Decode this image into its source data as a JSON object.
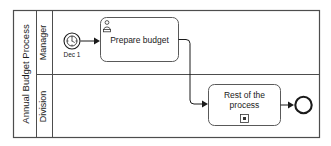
{
  "diagram": {
    "type": "bpmn-process-diagram",
    "pool": {
      "name": "Annual Budget Process",
      "lanes": [
        {
          "id": "manager",
          "name": "Manager"
        },
        {
          "id": "division",
          "name": "Division"
        }
      ]
    },
    "elements": [
      {
        "id": "start-timer",
        "kind": "timer-start-event",
        "lane": "manager",
        "label": "Dec 1",
        "icon": "clock-icon"
      },
      {
        "id": "prepare-budget",
        "kind": "user-task",
        "lane": "manager",
        "label": "Prepare budget",
        "icon": "user-task-icon"
      },
      {
        "id": "rest-of-process",
        "kind": "collapsed-subprocess",
        "lane": "division",
        "label_line1": "Rest of the",
        "label_line2": "process",
        "icon": "subprocess-marker-icon"
      },
      {
        "id": "end-event",
        "kind": "end-event",
        "lane": "division",
        "label": ""
      }
    ],
    "flows": [
      {
        "id": "flow-start-to-task",
        "from": "start-timer",
        "to": "prepare-budget"
      },
      {
        "id": "flow-task-to-subprocess",
        "from": "prepare-budget",
        "to": "rest-of-process"
      },
      {
        "id": "flow-subprocess-to-end",
        "from": "rest-of-process",
        "to": "end-event"
      }
    ],
    "colors": {
      "background": "#ffffff",
      "shape_stroke": "#595959",
      "frame_stroke": "#4d4d4d",
      "text": "#1a1a1a",
      "flow_stroke": "#1a1a1a"
    }
  }
}
